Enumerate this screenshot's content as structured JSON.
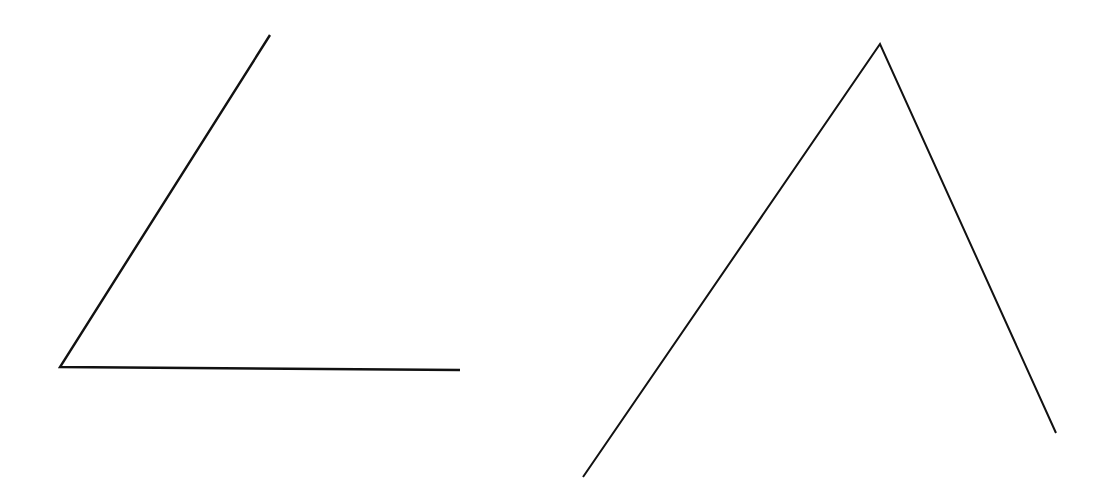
{
  "figures": [
    {
      "name": "angle",
      "stroke": "#111111",
      "points": [
        [
          270,
          35
        ],
        [
          60,
          367
        ],
        [
          460,
          370
        ]
      ]
    },
    {
      "name": "open-triangle",
      "stroke": "#111111",
      "points": [
        [
          583,
          477
        ],
        [
          880,
          44
        ],
        [
          1056,
          433
        ]
      ]
    }
  ]
}
